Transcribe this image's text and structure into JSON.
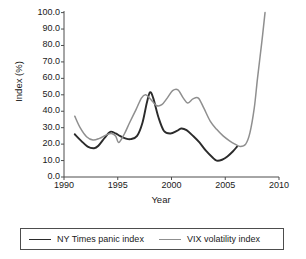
{
  "chart_data": {
    "type": "line",
    "title": "",
    "xlabel": "Year",
    "ylabel": "Index (%)",
    "xlim": [
      1990,
      2010
    ],
    "ylim": [
      0.0,
      100.0
    ],
    "grid": false,
    "legend_position": "bottom",
    "xticks": [
      "1990",
      "1995",
      "2000",
      "2005",
      "2010"
    ],
    "yticks": [
      "0.0",
      "10.0",
      "20.0",
      "30.0",
      "40.0",
      "50.0",
      "60.0",
      "70.0",
      "80.0",
      "90.0",
      "100.0"
    ],
    "series": [
      {
        "name": "NY Times panic index",
        "color": "#2b2b2b",
        "x": [
          1991.0,
          1991.6,
          1992.2,
          1992.8,
          1993.2,
          1993.8,
          1994.3,
          1994.8,
          1995.2,
          1995.7,
          1996.2,
          1996.8,
          1997.3,
          1997.7,
          1998.0,
          1998.3,
          1998.8,
          1999.3,
          1999.9,
          2000.5,
          2000.9,
          2001.4,
          2002.0,
          2002.6,
          2003.2,
          2003.8,
          2004.2,
          2004.7,
          2005.2,
          2005.7,
          2006.1
        ],
        "y": [
          26.0,
          22.0,
          18.5,
          17.5,
          19.0,
          24.0,
          27.5,
          26.5,
          25.0,
          23.5,
          23.0,
          25.0,
          33.0,
          45.0,
          51.5,
          48.0,
          36.0,
          28.0,
          26.5,
          28.0,
          29.5,
          28.5,
          25.0,
          21.0,
          16.0,
          12.0,
          10.0,
          10.5,
          12.5,
          15.5,
          18.5
        ]
      },
      {
        "name": "VIX volatility index",
        "color": "#8f8f8f",
        "x": [
          1991.0,
          1991.5,
          1992.1,
          1992.7,
          1993.3,
          1993.9,
          1994.4,
          1994.8,
          1995.1,
          1995.6,
          1996.1,
          1996.7,
          1997.2,
          1997.6,
          1998.1,
          1998.6,
          1999.1,
          1999.6,
          2000.1,
          2000.6,
          2001.1,
          2001.5,
          2002.0,
          2002.5,
          2003.0,
          2003.6,
          2004.2,
          2004.8,
          2005.4,
          2005.9,
          2006.4,
          2006.9,
          2007.3,
          2007.7,
          2008.0,
          2008.4,
          2008.7
        ],
        "y": [
          37.0,
          30.0,
          24.5,
          22.5,
          23.5,
          25.5,
          26.5,
          25.0,
          21.0,
          26.0,
          33.0,
          41.0,
          48.0,
          50.0,
          47.0,
          43.5,
          44.0,
          48.0,
          52.5,
          53.0,
          48.0,
          45.0,
          47.5,
          48.0,
          42.0,
          34.0,
          29.0,
          25.0,
          22.0,
          20.0,
          18.5,
          20.0,
          27.0,
          42.0,
          60.0,
          82.0,
          100.0
        ]
      }
    ]
  },
  "legend": {
    "entries": [
      {
        "label": "NY Times panic index"
      },
      {
        "label": "VIX volatility index"
      }
    ]
  }
}
